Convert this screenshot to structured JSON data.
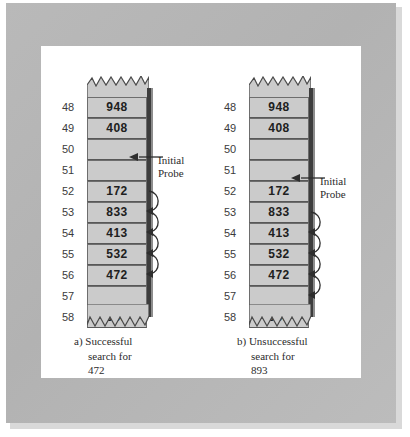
{
  "figure": {
    "colors": {
      "mat": "#b6b6b6",
      "mat_shadow": "#d9d9d9",
      "canvas": "#ffffff",
      "cell_fill": "#cbcbcb",
      "cell_border": "#6d6d6d",
      "spine": "#3d3d3d",
      "text": "#2b2b2b",
      "index_text": "#3b3b3b",
      "value_text": "#202020"
    }
  },
  "panels": [
    {
      "id": "a",
      "caption": {
        "line1": "a)  Successful",
        "line2": "search for",
        "line3": "472"
      },
      "probe_callout": {
        "line1": "Initial",
        "line2": "Probe",
        "target_index": "52",
        "leader_icon": "left-arrow-icon"
      },
      "rows": [
        {
          "index": "48",
          "value": "948"
        },
        {
          "index": "49",
          "value": "408"
        },
        {
          "index": "50",
          "value": ""
        },
        {
          "index": "51",
          "value": ""
        },
        {
          "index": "52",
          "value": "172"
        },
        {
          "index": "53",
          "value": "833"
        },
        {
          "index": "54",
          "value": "413"
        },
        {
          "index": "55",
          "value": "532"
        },
        {
          "index": "56",
          "value": "472"
        },
        {
          "index": "57",
          "value": ""
        },
        {
          "index": "58",
          "value": "358"
        }
      ],
      "probe_arcs": [
        {
          "from_index": "52",
          "to_index": "53"
        },
        {
          "from_index": "53",
          "to_index": "54"
        },
        {
          "from_index": "54",
          "to_index": "55"
        },
        {
          "from_index": "55",
          "to_index": "56"
        }
      ]
    },
    {
      "id": "b",
      "caption": {
        "line1": "b)  Unsuccessful",
        "line2": "search for",
        "line3": "893"
      },
      "probe_callout": {
        "line1": "Initial",
        "line2": "Probe",
        "target_index": "53",
        "leader_icon": "left-arrow-icon"
      },
      "rows": [
        {
          "index": "48",
          "value": "948"
        },
        {
          "index": "49",
          "value": "408"
        },
        {
          "index": "50",
          "value": ""
        },
        {
          "index": "51",
          "value": ""
        },
        {
          "index": "52",
          "value": "172"
        },
        {
          "index": "53",
          "value": "833"
        },
        {
          "index": "54",
          "value": "413"
        },
        {
          "index": "55",
          "value": "532"
        },
        {
          "index": "56",
          "value": "472"
        },
        {
          "index": "57",
          "value": ""
        },
        {
          "index": "58",
          "value": "358"
        }
      ],
      "probe_arcs": [
        {
          "from_index": "53",
          "to_index": "54"
        },
        {
          "from_index": "54",
          "to_index": "55"
        },
        {
          "from_index": "55",
          "to_index": "56"
        },
        {
          "from_index": "56",
          "to_index": "57"
        }
      ]
    }
  ]
}
